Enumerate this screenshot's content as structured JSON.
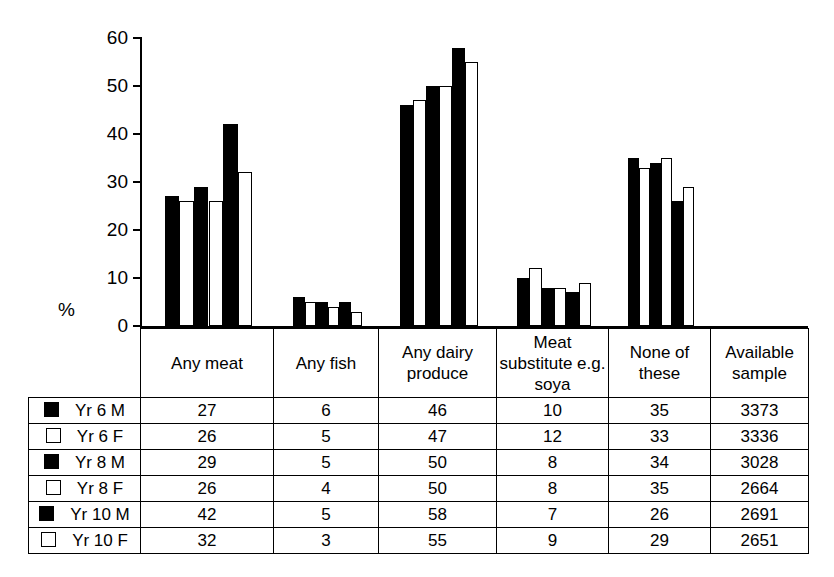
{
  "axis": {
    "y_label": "%",
    "y_ticks": [
      0,
      10,
      20,
      30,
      40,
      50,
      60
    ]
  },
  "legend": {
    "swatch_icons": [
      "filled-square-icon",
      "hollow-square-icon",
      "filled-square-icon",
      "hollow-square-icon",
      "filled-square-icon",
      "hollow-square-icon"
    ],
    "labels": [
      "Yr 6 M",
      "Yr 6 F",
      "Yr 8 M",
      "Yr 8 F",
      "Yr 10 M",
      "Yr 10 F"
    ]
  },
  "table": {
    "headers": [
      "Any meat",
      "Any fish",
      "Any dairy produce",
      "Meat substitute e.g. soya",
      "None of these",
      "Available sample"
    ],
    "rows": [
      {
        "label": "Yr 6 M",
        "swatch": "filled",
        "values": [
          "27",
          "6",
          "46",
          "10",
          "35",
          "3373"
        ]
      },
      {
        "label": "Yr 6 F",
        "swatch": "hollow",
        "values": [
          "26",
          "5",
          "47",
          "12",
          "33",
          "3336"
        ]
      },
      {
        "label": "Yr 8 M",
        "swatch": "filled",
        "values": [
          "29",
          "5",
          "50",
          "8",
          "34",
          "3028"
        ]
      },
      {
        "label": "Yr 8 F",
        "swatch": "hollow",
        "values": [
          "26",
          "4",
          "50",
          "8",
          "35",
          "2664"
        ]
      },
      {
        "label": "Yr 10 M",
        "swatch": "filled",
        "values": [
          "42",
          "5",
          "58",
          "7",
          "26",
          "2691"
        ]
      },
      {
        "label": "Yr 10 F",
        "swatch": "hollow",
        "values": [
          "32",
          "3",
          "55",
          "9",
          "29",
          "2651"
        ]
      }
    ]
  },
  "chart_data": {
    "type": "bar",
    "title": "",
    "xlabel": "",
    "ylabel": "%",
    "ylim": [
      0,
      60
    ],
    "yticks": [
      0,
      10,
      20,
      30,
      40,
      50,
      60
    ],
    "grid": false,
    "legend_position": "table-below",
    "categories": [
      "Any meat",
      "Any fish",
      "Any dairy produce",
      "Meat substitute e.g. soya",
      "None of these"
    ],
    "series": [
      {
        "name": "Yr 6 M",
        "style": "filled",
        "values": [
          27,
          6,
          46,
          10,
          35
        ],
        "available_sample": 3373
      },
      {
        "name": "Yr 6 F",
        "style": "hollow",
        "values": [
          26,
          5,
          47,
          12,
          33
        ],
        "available_sample": 3336
      },
      {
        "name": "Yr 8 M",
        "style": "filled",
        "values": [
          29,
          5,
          50,
          8,
          34
        ],
        "available_sample": 3028
      },
      {
        "name": "Yr 8 F",
        "style": "hollow",
        "values": [
          26,
          4,
          50,
          8,
          35
        ],
        "available_sample": 2664
      },
      {
        "name": "Yr 10 M",
        "style": "filled",
        "values": [
          42,
          5,
          58,
          7,
          26
        ],
        "available_sample": 2691
      },
      {
        "name": "Yr 10 F",
        "style": "hollow",
        "values": [
          32,
          3,
          55,
          9,
          29
        ],
        "available_sample": 2651
      }
    ]
  },
  "colors": {
    "bar_filled": "#000000",
    "bar_hollow": "#ffffff",
    "line": "#000000",
    "background": "#ffffff"
  }
}
